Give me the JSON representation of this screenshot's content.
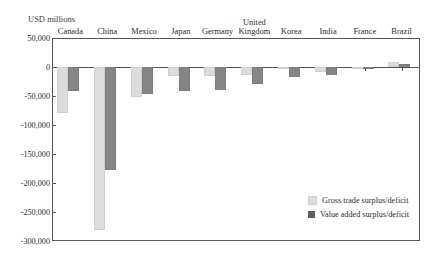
{
  "units_label": "USD millions",
  "colors": {
    "gross": "#dcdcdc",
    "value": "#858585",
    "axis": "#555555",
    "text": "#2b2b2b"
  },
  "legend": {
    "position": "bottom-right",
    "items": [
      {
        "key": "gross",
        "label": "Gross trade surplus/deficit"
      },
      {
        "key": "value",
        "label": "Value added surplus/deficit"
      }
    ]
  },
  "yaxis": {
    "ticks": [
      "50,000",
      "0",
      "-50,000",
      "-100,000",
      "-150,000",
      "-200,000",
      "-250,000",
      "-300,000"
    ],
    "tick_values": [
      50000,
      0,
      -50000,
      -100000,
      -150000,
      -200000,
      -250000,
      -300000
    ],
    "min": -300000,
    "max": 50000
  },
  "chart_data": {
    "type": "bar",
    "title": "",
    "subtitle": "",
    "xlabel": "",
    "ylabel": "USD millions",
    "ylim": [
      -300000,
      50000
    ],
    "grid": false,
    "legend_position": "bottom-right",
    "categories": [
      "Canada",
      "China",
      "Mexico",
      "Japan",
      "Germany",
      "United Kingdom",
      "Korea",
      "India",
      "France",
      "Brazil"
    ],
    "series": [
      {
        "name": "Gross trade surplus/deficit",
        "color": "#dcdcdc",
        "values": [
          -79000,
          -281000,
          -52000,
          -15000,
          -15000,
          -14000,
          -2000,
          -8000,
          -1000,
          9000
        ]
      },
      {
        "name": "Value added surplus/deficit",
        "color": "#858585",
        "values": [
          -42000,
          -178000,
          -46000,
          -41000,
          -40000,
          -30000,
          -17000,
          -14000,
          -2000,
          6000
        ]
      }
    ]
  }
}
